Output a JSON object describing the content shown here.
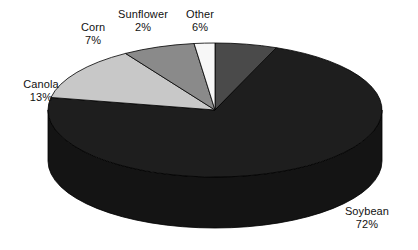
{
  "chart_data": {
    "type": "pie",
    "title": "",
    "subtitle": "",
    "xlabel": "",
    "ylabel": "",
    "legend_position": "none",
    "grid": false,
    "three_d": true,
    "units": "percent",
    "categories": [
      "Other",
      "Soybean",
      "Canola",
      "Corn",
      "Sunflower"
    ],
    "values": [
      6,
      72,
      13,
      7,
      2
    ],
    "slices": [
      {
        "label": "Other",
        "value": 6,
        "value_text": "6%",
        "color": "#4a4a4a",
        "side_color": "#3a3a3a",
        "start_deg": 0,
        "end_deg": 21.6
      },
      {
        "label": "Soybean",
        "value": 72,
        "value_text": "72%",
        "color": "#1e1e1e",
        "side_color": "#141414",
        "start_deg": 21.6,
        "end_deg": 280.8
      },
      {
        "label": "Canola",
        "value": 13,
        "value_text": "13%",
        "color": "#c8c8c8",
        "side_color": "#a0a0a0",
        "start_deg": 280.8,
        "end_deg": 327.6
      },
      {
        "label": "Corn",
        "value": 7,
        "value_text": "7%",
        "color": "#8a8a8a",
        "side_color": "#6e6e6e",
        "start_deg": 327.6,
        "end_deg": 352.8
      },
      {
        "label": "Sunflower",
        "value": 2,
        "value_text": "2%",
        "color": "#f7f7f7",
        "side_color": "#d0d0d0",
        "start_deg": 352.8,
        "end_deg": 360
      }
    ],
    "labels": {
      "canola": {
        "name": "Canola",
        "value_text": "13%"
      },
      "corn": {
        "name": "Corn",
        "value_text": "7%"
      },
      "sunflower": {
        "name": "Sunflower",
        "value_text": "2%"
      },
      "other": {
        "name": "Other",
        "value_text": "6%"
      },
      "soybean": {
        "name": "Soybean",
        "value_text": "72%"
      }
    },
    "background_color": "#ffffff",
    "label_text_color": "#111111"
  }
}
